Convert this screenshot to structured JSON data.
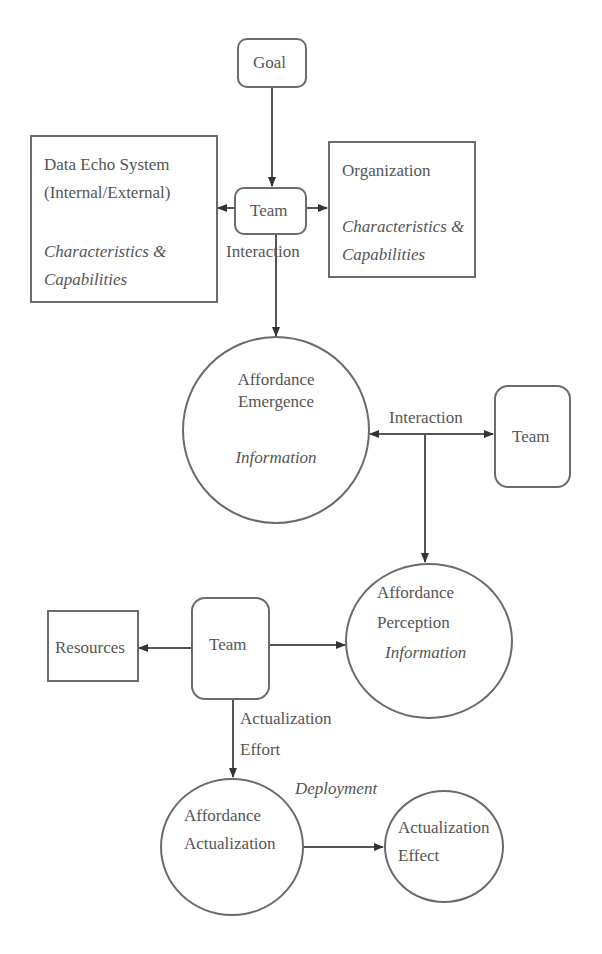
{
  "nodes": {
    "goal": {
      "label": "Goal"
    },
    "data_echo": {
      "title_line1": "Data Echo System",
      "title_line2": "(Internal/External)",
      "sub_line1": "Characteristics &",
      "sub_line2": "Capabilities"
    },
    "team_top": {
      "label": "Team",
      "caption": "Interaction"
    },
    "organization": {
      "title": "Organization",
      "sub_line1": "Characteristics &",
      "sub_line2": "Capabilities"
    },
    "affordance_emergence": {
      "line1": "Affordance",
      "line2": "Emergence",
      "sub": "Information"
    },
    "team_right": {
      "label": "Team"
    },
    "interaction_edge": {
      "label": "Interaction"
    },
    "affordance_perception": {
      "line1": "Affordance",
      "line2": "Perception",
      "sub": "Information"
    },
    "team_mid": {
      "label": "Team"
    },
    "resources": {
      "label": "Resources"
    },
    "actualization_effort": {
      "line1": "Actualization",
      "line2": "Effort"
    },
    "deployment": {
      "label": "Deployment"
    },
    "affordance_actualization": {
      "line1": "Affordance",
      "line2": "Actualization"
    },
    "actualization_effect": {
      "line1": "Actualization",
      "line2": "Effect"
    }
  },
  "edges": [
    {
      "from": "Goal",
      "to": "Team"
    },
    {
      "from": "Team",
      "to": "Data Echo System",
      "type": "arrow"
    },
    {
      "from": "Team",
      "to": "Organization",
      "type": "arrow"
    },
    {
      "from": "Team",
      "to": "Affordance Emergence",
      "label": "Interaction"
    },
    {
      "from": "Affordance Emergence",
      "to": "Team",
      "type": "bidirectional",
      "label": "Interaction"
    },
    {
      "from": "Interaction",
      "to": "Affordance Perception"
    },
    {
      "from": "Team",
      "to": "Resources"
    },
    {
      "from": "Team",
      "to": "Affordance Perception"
    },
    {
      "from": "Team",
      "to": "Affordance Actualization",
      "label": "Actualization Effort"
    },
    {
      "from": "Affordance Actualization",
      "to": "Actualization Effect",
      "label": "Deployment"
    }
  ]
}
